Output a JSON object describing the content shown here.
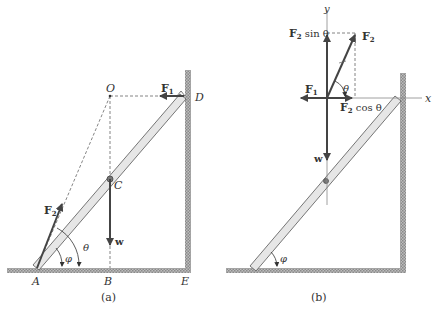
{
  "figure": {
    "colors": {
      "ink": "#333333",
      "ladder_fill": "#e6e6e6",
      "hatch": "#9a9a9a",
      "dashed": "#666666",
      "arrow": "#444444"
    }
  },
  "panel_a": {
    "caption": "(a)",
    "points": {
      "O": "O",
      "D": "D",
      "C": "C",
      "A": "A",
      "B": "B",
      "E": "E"
    },
    "forces": {
      "F1": "F",
      "F1_sub": "1",
      "F2": "F",
      "F2_sub": "2",
      "w": "w"
    },
    "angles": {
      "phi": "φ",
      "theta": "θ"
    }
  },
  "panel_b": {
    "caption": "(b)",
    "axes": {
      "x": "x",
      "y": "y"
    },
    "forces": {
      "F1": "F",
      "F1_sub": "1",
      "F2": "F",
      "F2_sub": "2",
      "F2_sin": "F",
      "F2_sin_sub": "2",
      "F2_sin_tail": " sin θ",
      "F2_cos": "F",
      "F2_cos_sub": "2",
      "F2_cos_tail": " cos θ",
      "w": "w"
    },
    "angles": {
      "phi": "φ",
      "theta": "θ"
    }
  }
}
